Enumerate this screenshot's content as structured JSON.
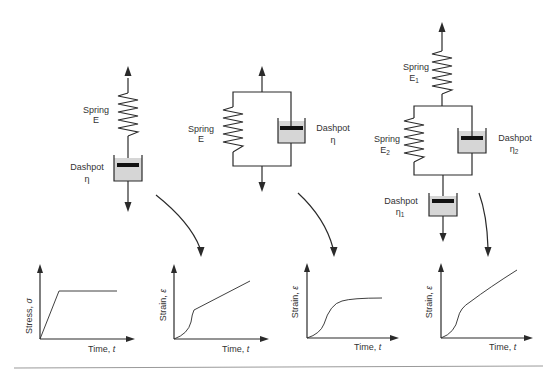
{
  "models": {
    "maxwell": {
      "name": "Maxwell model (series)",
      "spring_label": "Spring",
      "spring_symbol": "E",
      "dashpot_label": "Dashpot",
      "dashpot_symbol": "η"
    },
    "kelvin_voigt": {
      "name": "Kelvin-Voigt model (parallel)",
      "spring_label": "Spring",
      "spring_symbol": "E",
      "dashpot_label": "Dashpot",
      "dashpot_symbol": "η"
    },
    "burgers": {
      "name": "Four-element (Burgers) model",
      "spring1_label": "Spring",
      "spring1_symbol": "E",
      "spring1_sub": "1",
      "spring2_label": "Spring",
      "spring2_symbol": "E",
      "spring2_sub": "2",
      "dashpot2_label": "Dashpot",
      "dashpot2_symbol": "η",
      "dashpot2_sub": "2",
      "dashpot1_label": "Dashpot",
      "dashpot1_symbol": "η",
      "dashpot1_sub": "1"
    }
  },
  "graphs": [
    {
      "id": "applied-stress",
      "ylabel": "Stress, ",
      "ysym": "σ",
      "xlabel": "Time, ",
      "xsym": "t",
      "shape": "ramp then constant"
    },
    {
      "id": "maxwell-strain",
      "ylabel": "Strain, ",
      "ysym": "ε",
      "xlabel": "Time, ",
      "xsym": "t",
      "shape": "curve then linear creep"
    },
    {
      "id": "kelvin-strain",
      "ylabel": "Strain, ",
      "ysym": "ε",
      "xlabel": "Time, ",
      "xsym": "t",
      "shape": "sigmoid to plateau"
    },
    {
      "id": "burgers-strain",
      "ylabel": "Strain, ",
      "ysym": "ε",
      "xlabel": "Time, ",
      "xsym": "t",
      "shape": "sigmoid then continued creep"
    }
  ],
  "colors": {
    "line": "#2a2a2a",
    "dashpot_fill": "#d6d6d6",
    "piston": "#111111",
    "text": "#333333",
    "rule": "#9a9a9a"
  }
}
